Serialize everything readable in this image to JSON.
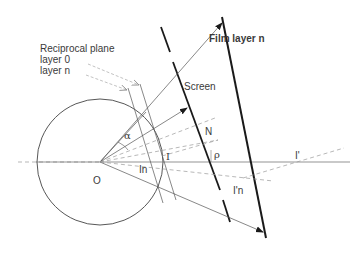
{
  "diagram": {
    "labels": {
      "reciprocal_plane": "Reciprocal plane",
      "layer_0": "layer 0",
      "layer_n": "layer n",
      "film_layer_n": "Film layer n",
      "screen": "Screen",
      "alpha": "α",
      "n_label": "N",
      "rho": "ρ",
      "origin": "O",
      "i_label": "I",
      "in_label": "In",
      "i_prime": "I'",
      "i_prime_n": "I'n"
    },
    "colors": {
      "thick_line": "#1a1a1a",
      "thin_line": "#555555",
      "dashed_line": "#9a9a9a",
      "text": "#3a3a3a"
    }
  }
}
